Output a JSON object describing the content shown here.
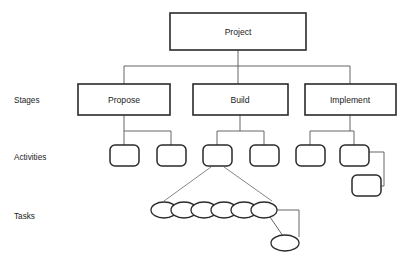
{
  "diagram": {
    "type": "work-breakdown-structure",
    "root": {
      "label": "Project",
      "shape": "rectangle",
      "x": 170,
      "y": 13,
      "w": 136,
      "h": 37
    },
    "row_labels": [
      {
        "name": "stages",
        "label": "Stages",
        "x": 14,
        "y": 101
      },
      {
        "name": "activities",
        "label": "Activities",
        "x": 14,
        "y": 158
      },
      {
        "name": "tasks",
        "label": "Tasks",
        "x": 14,
        "y": 217
      }
    ],
    "stages": [
      {
        "label": "Propose",
        "shape": "rectangle",
        "x": 78,
        "y": 84,
        "w": 92,
        "h": 31
      },
      {
        "label": "Build",
        "shape": "rectangle",
        "x": 193,
        "y": 84,
        "w": 95,
        "h": 31
      },
      {
        "label": "Implement",
        "shape": "rectangle",
        "x": 305,
        "y": 84,
        "w": 91,
        "h": 31
      }
    ],
    "activities": [
      {
        "label": "",
        "shape": "rounded-rectangle",
        "x": 110,
        "y": 145,
        "w": 29,
        "h": 21
      },
      {
        "label": "",
        "shape": "rounded-rectangle",
        "x": 157,
        "y": 145,
        "w": 29,
        "h": 21
      },
      {
        "label": "",
        "shape": "rounded-rectangle",
        "x": 203,
        "y": 145,
        "w": 29,
        "h": 21
      },
      {
        "label": "",
        "shape": "rounded-rectangle",
        "x": 250,
        "y": 145,
        "w": 29,
        "h": 21
      },
      {
        "label": "",
        "shape": "rounded-rectangle",
        "x": 296,
        "y": 145,
        "w": 29,
        "h": 21
      },
      {
        "label": "",
        "shape": "rounded-rectangle",
        "x": 340,
        "y": 145,
        "w": 29,
        "h": 21
      },
      {
        "label": "",
        "shape": "rounded-rectangle",
        "x": 352,
        "y": 175,
        "w": 29,
        "h": 21
      }
    ],
    "tasks": [
      {
        "label": "",
        "shape": "ellipse",
        "cx": 164,
        "cy": 210,
        "rx": 13,
        "ry": 8
      },
      {
        "label": "",
        "shape": "ellipse",
        "cx": 184,
        "cy": 210,
        "rx": 13,
        "ry": 8
      },
      {
        "label": "",
        "shape": "ellipse",
        "cx": 204,
        "cy": 210,
        "rx": 13,
        "ry": 8
      },
      {
        "label": "",
        "shape": "ellipse",
        "cx": 224,
        "cy": 210,
        "rx": 13,
        "ry": 8
      },
      {
        "label": "",
        "shape": "ellipse",
        "cx": 244,
        "cy": 210,
        "rx": 13,
        "ry": 8
      },
      {
        "label": "",
        "shape": "ellipse",
        "cx": 264,
        "cy": 210,
        "rx": 13,
        "ry": 8
      },
      {
        "label": "",
        "shape": "ellipse",
        "cx": 285,
        "cy": 243,
        "rx": 14,
        "ry": 8
      }
    ],
    "colors": {
      "background": "#ffffff",
      "node_stroke": "#2a2a2a",
      "connector_stroke": "#555555",
      "text": "#1a1a1a"
    }
  }
}
